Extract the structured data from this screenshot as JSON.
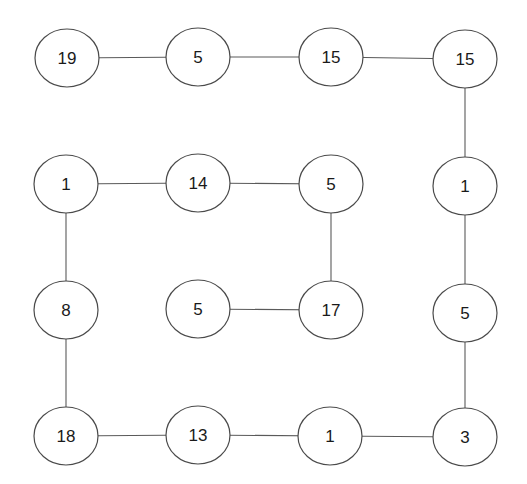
{
  "diagram": {
    "type": "graph",
    "node_shape": "ellipse",
    "node_rx": 32,
    "node_ry": 29,
    "nodes": [
      {
        "id": "r1c1",
        "label": "19",
        "x": 67,
        "y": 58
      },
      {
        "id": "r1c2",
        "label": "5",
        "x": 198,
        "y": 57
      },
      {
        "id": "r1c3",
        "label": "15",
        "x": 331,
        "y": 57
      },
      {
        "id": "r1c4",
        "label": "15",
        "x": 465,
        "y": 59
      },
      {
        "id": "r2c1",
        "label": "1",
        "x": 66,
        "y": 184
      },
      {
        "id": "r2c2",
        "label": "14",
        "x": 198,
        "y": 183
      },
      {
        "id": "r2c3",
        "label": "5",
        "x": 331,
        "y": 184
      },
      {
        "id": "r2c4",
        "label": "1",
        "x": 465,
        "y": 186
      },
      {
        "id": "r3c1",
        "label": "8",
        "x": 66,
        "y": 310
      },
      {
        "id": "r3c2",
        "label": "5",
        "x": 198,
        "y": 309
      },
      {
        "id": "r3c3",
        "label": "17",
        "x": 331,
        "y": 310
      },
      {
        "id": "r3c4",
        "label": "5",
        "x": 465,
        "y": 313
      },
      {
        "id": "r4c1",
        "label": "18",
        "x": 66,
        "y": 436
      },
      {
        "id": "r4c2",
        "label": "13",
        "x": 198,
        "y": 435
      },
      {
        "id": "r4c3",
        "label": "1",
        "x": 330,
        "y": 436
      },
      {
        "id": "r4c4",
        "label": "3",
        "x": 465,
        "y": 437
      }
    ],
    "edges": [
      [
        "r1c1",
        "r1c2"
      ],
      [
        "r1c2",
        "r1c3"
      ],
      [
        "r1c3",
        "r1c4"
      ],
      [
        "r1c4",
        "r2c4"
      ],
      [
        "r2c1",
        "r2c2"
      ],
      [
        "r2c2",
        "r2c3"
      ],
      [
        "r2c3",
        "r3c3"
      ],
      [
        "r3c2",
        "r3c3"
      ],
      [
        "r2c1",
        "r3c1"
      ],
      [
        "r3c1",
        "r4c1"
      ],
      [
        "r4c1",
        "r4c2"
      ],
      [
        "r4c2",
        "r4c3"
      ],
      [
        "r4c3",
        "r4c4"
      ],
      [
        "r2c4",
        "r3c4"
      ],
      [
        "r3c4",
        "r4c4"
      ]
    ]
  }
}
